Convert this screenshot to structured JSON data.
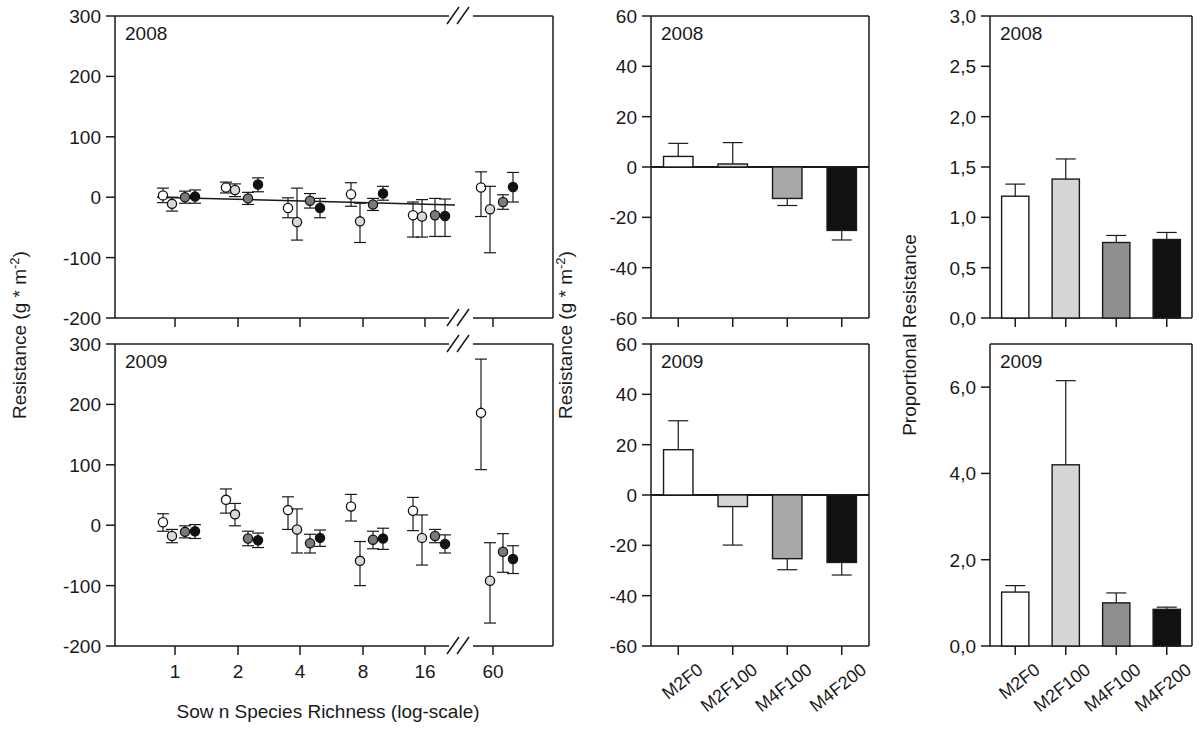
{
  "figure": {
    "panels": [
      {
        "id": "A1",
        "year": "2008",
        "column": "scatter"
      },
      {
        "id": "A2",
        "year": "2009",
        "column": "scatter"
      },
      {
        "id": "B1",
        "year": "2008",
        "column": "bar-resistance"
      },
      {
        "id": "B2",
        "year": "2009",
        "column": "bar-resistance"
      },
      {
        "id": "C1",
        "year": "2008",
        "column": "bar-proportional"
      },
      {
        "id": "C2",
        "year": "2009",
        "column": "bar-proportional"
      }
    ],
    "axis_titles": {
      "left_y": "Resistance (g * m",
      "left_y_sup": "-2",
      "left_y_close": ")",
      "mid_y": "Resistance (g * m",
      "mid_y_sup": "-2",
      "mid_y_close": ")",
      "right_y": "Proportional Resistance",
      "left_x": "Sow n Species Richness (log-scale)"
    },
    "axis_break_glyph": "//"
  },
  "chart_data": [
    {
      "type": "scatter",
      "id": "scatter-2008",
      "title": "2008",
      "xlabel": "Sow n Species Richness (log-scale)",
      "ylabel": "Resistance (g * m-2)",
      "ylim": [
        -200,
        300
      ],
      "yticks": [
        -200,
        -100,
        0,
        100,
        200,
        300
      ],
      "ytick_labels": [
        "-200",
        "-100",
        "0",
        "100",
        "200",
        "300"
      ],
      "xticks": [
        1,
        2,
        4,
        8,
        16,
        60
      ],
      "xtick_labels": [
        "1",
        "2",
        "4",
        "8",
        "16",
        "60"
      ],
      "x_axis_broken_between": [
        16,
        60
      ],
      "grid": false,
      "legend": "none",
      "series": [
        {
          "name": "M2F0",
          "marker": "open-circle",
          "fill": "#ffffff",
          "x": [
            1,
            2,
            4,
            8,
            16,
            60
          ],
          "y": [
            3,
            16,
            -18,
            5,
            -30,
            16
          ],
          "err_lo": [
            12,
            9,
            16,
            20,
            36,
            48
          ],
          "err_hi": [
            12,
            9,
            17,
            19,
            22,
            26
          ]
        },
        {
          "name": "M2F100",
          "marker": "lightgray-circle",
          "fill": "#d9d9d9",
          "x": [
            1,
            2,
            4,
            8,
            16,
            60
          ],
          "y": [
            -11,
            12,
            -41,
            -40,
            -32,
            -20
          ],
          "err_lo": [
            12,
            11,
            30,
            35,
            34,
            72
          ],
          "err_hi": [
            11,
            10,
            56,
            30,
            28,
            38
          ]
        },
        {
          "name": "M4F100",
          "marker": "darkgray-circle",
          "fill": "#7a7a7a",
          "x": [
            1,
            2,
            4,
            8,
            16,
            60
          ],
          "y": [
            0,
            -2,
            -6,
            -12,
            -30,
            -8
          ],
          "err_lo": [
            10,
            10,
            12,
            10,
            35,
            12
          ],
          "err_hi": [
            10,
            10,
            12,
            10,
            28,
            12
          ]
        },
        {
          "name": "M4F200",
          "marker": "black-circle",
          "fill": "#111111",
          "x": [
            1,
            2,
            4,
            8,
            16,
            60
          ],
          "y": [
            1,
            21,
            -18,
            6,
            -31,
            17
          ],
          "err_lo": [
            11,
            12,
            16,
            11,
            34,
            25
          ],
          "err_hi": [
            11,
            11,
            16,
            12,
            28,
            24
          ]
        }
      ],
      "trendline": {
        "from": [
          1,
          0
        ],
        "to": [
          16,
          -13
        ],
        "note": "fitted regression line"
      }
    },
    {
      "type": "scatter",
      "id": "scatter-2009",
      "title": "2009",
      "xlabel": "Sow n Species Richness (log-scale)",
      "ylabel": "Resistance (g * m-2)",
      "ylim": [
        -200,
        300
      ],
      "yticks": [
        -200,
        -100,
        0,
        100,
        200,
        300
      ],
      "ytick_labels": [
        "-200",
        "-100",
        "0",
        "100",
        "200",
        "300"
      ],
      "xticks": [
        1,
        2,
        4,
        8,
        16,
        60
      ],
      "xtick_labels": [
        "1",
        "2",
        "4",
        "8",
        "16",
        "60"
      ],
      "x_axis_broken_between": [
        16,
        60
      ],
      "grid": false,
      "legend": "none",
      "series": [
        {
          "name": "M2F0",
          "marker": "open-circle",
          "fill": "#ffffff",
          "x": [
            1,
            2,
            4,
            8,
            16,
            60
          ],
          "y": [
            5,
            42,
            25,
            31,
            24,
            186
          ],
          "err_lo": [
            15,
            22,
            32,
            24,
            33,
            94
          ],
          "err_hi": [
            14,
            18,
            22,
            20,
            22,
            89
          ]
        },
        {
          "name": "M2F100",
          "marker": "lightgray-circle",
          "fill": "#d9d9d9",
          "x": [
            1,
            2,
            4,
            8,
            16,
            60
          ],
          "y": [
            -18,
            18,
            -7,
            -59,
            -21,
            -92
          ],
          "err_lo": [
            11,
            19,
            39,
            41,
            45,
            70
          ],
          "err_hi": [
            11,
            18,
            34,
            32,
            38,
            63
          ]
        },
        {
          "name": "M4F100",
          "marker": "darkgray-circle",
          "fill": "#7a7a7a",
          "x": [
            1,
            2,
            4,
            8,
            16,
            60
          ],
          "y": [
            -11,
            -22,
            -30,
            -24,
            -18,
            -44
          ],
          "err_lo": [
            10,
            12,
            16,
            15,
            11,
            34
          ],
          "err_hi": [
            10,
            12,
            15,
            14,
            11,
            30
          ]
        },
        {
          "name": "M4F200",
          "marker": "black-circle",
          "fill": "#111111",
          "x": [
            1,
            2,
            4,
            8,
            16,
            60
          ],
          "y": [
            -10,
            -25,
            -21,
            -22,
            -31,
            -56
          ],
          "err_lo": [
            12,
            12,
            14,
            18,
            15,
            24
          ],
          "err_hi": [
            11,
            12,
            13,
            17,
            15,
            22
          ]
        }
      ],
      "trendline": null
    },
    {
      "type": "bar",
      "id": "bar-resistance-2008",
      "title": "2008",
      "ylabel": "Resistance (g * m-2)",
      "ylim": [
        -60,
        60
      ],
      "yticks": [
        -60,
        -40,
        -20,
        0,
        20,
        40,
        60
      ],
      "ytick_labels": [
        "-60",
        "-40",
        "-20",
        "0",
        "20",
        "40",
        "60"
      ],
      "categories": [
        "M2F0",
        "M2F100",
        "M4F100",
        "M4F200"
      ],
      "values": [
        4.2,
        1.2,
        -12.5,
        -25.2
      ],
      "errors": [
        5.2,
        8.5,
        2.8,
        3.8
      ],
      "bar_fills": [
        "#ffffff",
        "#d6d6d6",
        "#a8a8a8",
        "#111111"
      ],
      "grid": false,
      "legend": "none"
    },
    {
      "type": "bar",
      "id": "bar-resistance-2009",
      "title": "2009",
      "ylabel": "Resistance (g * m-2)",
      "ylim": [
        -60,
        60
      ],
      "yticks": [
        -60,
        -40,
        -20,
        0,
        20,
        40,
        60
      ],
      "ytick_labels": [
        "-60",
        "-40",
        "-20",
        "0",
        "20",
        "40",
        "60"
      ],
      "categories": [
        "M2F0",
        "M2F100",
        "M4F100",
        "M4F200"
      ],
      "values": [
        18.0,
        -4.6,
        -25.3,
        -26.8
      ],
      "errors": [
        11.5,
        15.3,
        4.4,
        5.0
      ],
      "bar_fills": [
        "#ffffff",
        "#d6d6d6",
        "#a8a8a8",
        "#111111"
      ],
      "grid": false,
      "legend": "none"
    },
    {
      "type": "bar",
      "id": "bar-proportional-2008",
      "title": "2008",
      "ylabel": "Proportional Resistance",
      "ylim": [
        0,
        3.0
      ],
      "yticks": [
        0.0,
        0.5,
        1.0,
        1.5,
        2.0,
        2.5,
        3.0
      ],
      "ytick_labels": [
        "0,0",
        "0,5",
        "1,0",
        "1,5",
        "2,0",
        "2,5",
        "3,0"
      ],
      "categories": [
        "M2F0",
        "M2F100",
        "M4F100",
        "M4F200"
      ],
      "values": [
        1.21,
        1.38,
        0.75,
        0.78
      ],
      "errors": [
        0.12,
        0.2,
        0.07,
        0.07
      ],
      "bar_fills": [
        "#ffffff",
        "#d6d6d6",
        "#8f8f8f",
        "#111111"
      ],
      "grid": false,
      "legend": "none"
    },
    {
      "type": "bar",
      "id": "bar-proportional-2009",
      "title": "2009",
      "ylabel": "Proportional Resistance",
      "ylim": [
        0,
        7.0
      ],
      "yticks": [
        0.0,
        2.0,
        4.0,
        6.0
      ],
      "ytick_labels": [
        "0,0",
        "2,0",
        "4,0",
        "6,0"
      ],
      "categories": [
        "M2F0",
        "M2F100",
        "M4F100",
        "M4F200"
      ],
      "values": [
        1.25,
        4.2,
        1.0,
        0.85
      ],
      "errors": [
        0.15,
        1.95,
        0.23,
        0.05
      ],
      "bar_fills": [
        "#ffffff",
        "#d6d6d6",
        "#8f8f8f",
        "#111111"
      ],
      "grid": false,
      "legend": "none"
    }
  ]
}
